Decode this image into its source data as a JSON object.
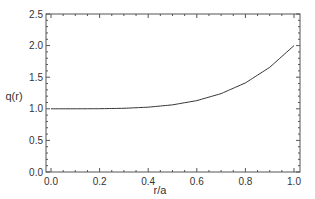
{
  "chart_data": {
    "type": "line",
    "title": "",
    "xlabel": "r/a",
    "ylabel": "q(r)",
    "xlim": [
      0.0,
      1.0
    ],
    "ylim": [
      0.0,
      2.5
    ],
    "grid": false,
    "legend": null,
    "x_ticks": [
      "0.0",
      "0.2",
      "0.4",
      "0.6",
      "0.8",
      "1.0"
    ],
    "y_ticks": [
      "0.0",
      "0.5",
      "1.0",
      "1.5",
      "2.0",
      "2.5"
    ],
    "series": [
      {
        "name": "q(r)",
        "color": "#333333",
        "x": [
          0.0,
          0.1,
          0.2,
          0.3,
          0.4,
          0.5,
          0.6,
          0.7,
          0.8,
          0.9,
          1.0
        ],
        "y": [
          1.0,
          1.0001,
          1.0016,
          1.0081,
          1.0256,
          1.0625,
          1.1296,
          1.2401,
          1.4096,
          1.6561,
          2.0
        ]
      }
    ]
  },
  "axes": {
    "xlabel": "r/a",
    "ylabel": "q(r)"
  }
}
